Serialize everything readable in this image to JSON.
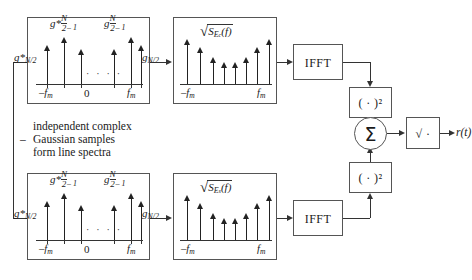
{
  "diagram": {
    "annotation": {
      "line1": "independent complex",
      "line2": "Gaussian samples",
      "line3": "form line spectra",
      "dash": "–"
    },
    "output_label": "r(t)",
    "branches": [
      {
        "id": "upper",
        "spectrum": {
          "label_left_edge": "g*",
          "label_left_edge_sub": "N/2",
          "label_left_inner_main": "g*",
          "label_left_inner_sub_num": "N",
          "label_left_inner_sub_den": "2",
          "label_left_inner_sub_tail": "– 1",
          "label_right_inner_main": "g",
          "label_right_inner_sub_num": "N",
          "label_right_inner_sub_den": "2",
          "label_right_inner_sub_tail": "– 1",
          "label_right_edge": "g",
          "label_right_edge_sub": "N/2",
          "axis_left": "–f",
          "axis_left_sub": "m",
          "axis_center": "0",
          "axis_right": "f",
          "axis_right_sub": "m",
          "ellipsis": "· · · ·",
          "stem_heights": [
            34,
            42,
            30,
            30,
            42,
            34
          ]
        },
        "psd": {
          "radical_prefix": "√",
          "radical_body": "S",
          "radical_sub": "E",
          "radical_sub2": "c",
          "radical_arg": "(f)",
          "axis_left": "–f",
          "axis_left_sub": "m",
          "axis_right": "f",
          "axis_right_sub": "m",
          "stem_heights": [
            40,
            32,
            22,
            17,
            17,
            22,
            32,
            40
          ]
        },
        "ifft_label": "IFFT",
        "square_label": "( · )²"
      },
      {
        "id": "lower",
        "spectrum": {
          "label_left_edge": "g*",
          "label_left_edge_sub": "N/2",
          "label_left_inner_main": "g*",
          "label_left_inner_sub_num": "N",
          "label_left_inner_sub_den": "2",
          "label_left_inner_sub_tail": "– 1",
          "label_right_inner_main": "g",
          "label_right_inner_sub_num": "N",
          "label_right_inner_sub_den": "2",
          "label_right_inner_sub_tail": "– 1",
          "label_right_edge": "g",
          "label_right_edge_sub": "N/2",
          "axis_left": "–f",
          "axis_left_sub": "m",
          "axis_center": "0",
          "axis_right": "f",
          "axis_right_sub": "m",
          "ellipsis": "· · · ·",
          "stem_heights": [
            34,
            42,
            30,
            30,
            42,
            34
          ]
        },
        "psd": {
          "radical_prefix": "√",
          "radical_body": "S",
          "radical_sub": "E",
          "radical_sub2": "s",
          "radical_arg": "(f)",
          "axis_left": "–f",
          "axis_left_sub": "m",
          "axis_right": "f",
          "axis_right_sub": "m",
          "stem_heights": [
            40,
            32,
            22,
            17,
            17,
            22,
            32,
            40
          ]
        },
        "ifft_label": "IFFT",
        "square_label": "( · )²"
      }
    ],
    "sum_label": "Σ",
    "sqrt_label": "√ ·",
    "colors": {
      "stroke": "#555555",
      "ink": "#1a1a1a",
      "background": "#ffffff"
    }
  }
}
